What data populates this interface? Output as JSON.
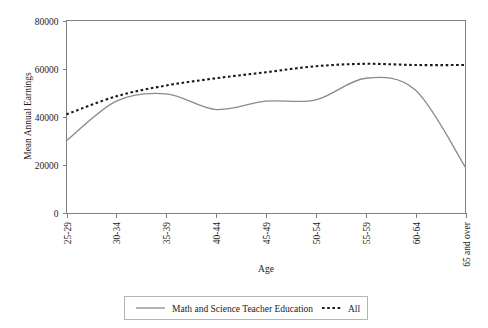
{
  "chart_data": {
    "type": "line",
    "title": "",
    "xlabel": "Age",
    "ylabel": "Mean Annual Earnings",
    "categories": [
      "25-29",
      "30-34",
      "35-39",
      "40-44",
      "45-49",
      "50-54",
      "55-59",
      "60-64",
      "65 and over"
    ],
    "ylim": [
      0,
      80000
    ],
    "yticks": [
      0,
      20000,
      40000,
      60000,
      80000
    ],
    "ytick_labels": [
      "0",
      "20000",
      "40000",
      "60000",
      "80000"
    ],
    "grid": false,
    "legend_position": "bottom",
    "series": [
      {
        "name": "Math and Science Teacher Education",
        "style": "solid",
        "color": "#8a8a8a",
        "values": [
          30000,
          46500,
          49500,
          43000,
          46500,
          47000,
          56000,
          51000,
          19000
        ]
      },
      {
        "name": "All",
        "style": "dotted",
        "color": "#1a1a1a",
        "values": [
          41000,
          48500,
          53000,
          56000,
          58500,
          61000,
          62000,
          61500,
          61500
        ]
      }
    ]
  },
  "axes": {
    "y_axis_title": "Mean Annual Earnings",
    "x_axis_title": "Age"
  },
  "legend": {
    "items": [
      {
        "label": "Math and Science Teacher Education",
        "style": "solid"
      },
      {
        "label": "All",
        "style": "dotted"
      }
    ]
  }
}
